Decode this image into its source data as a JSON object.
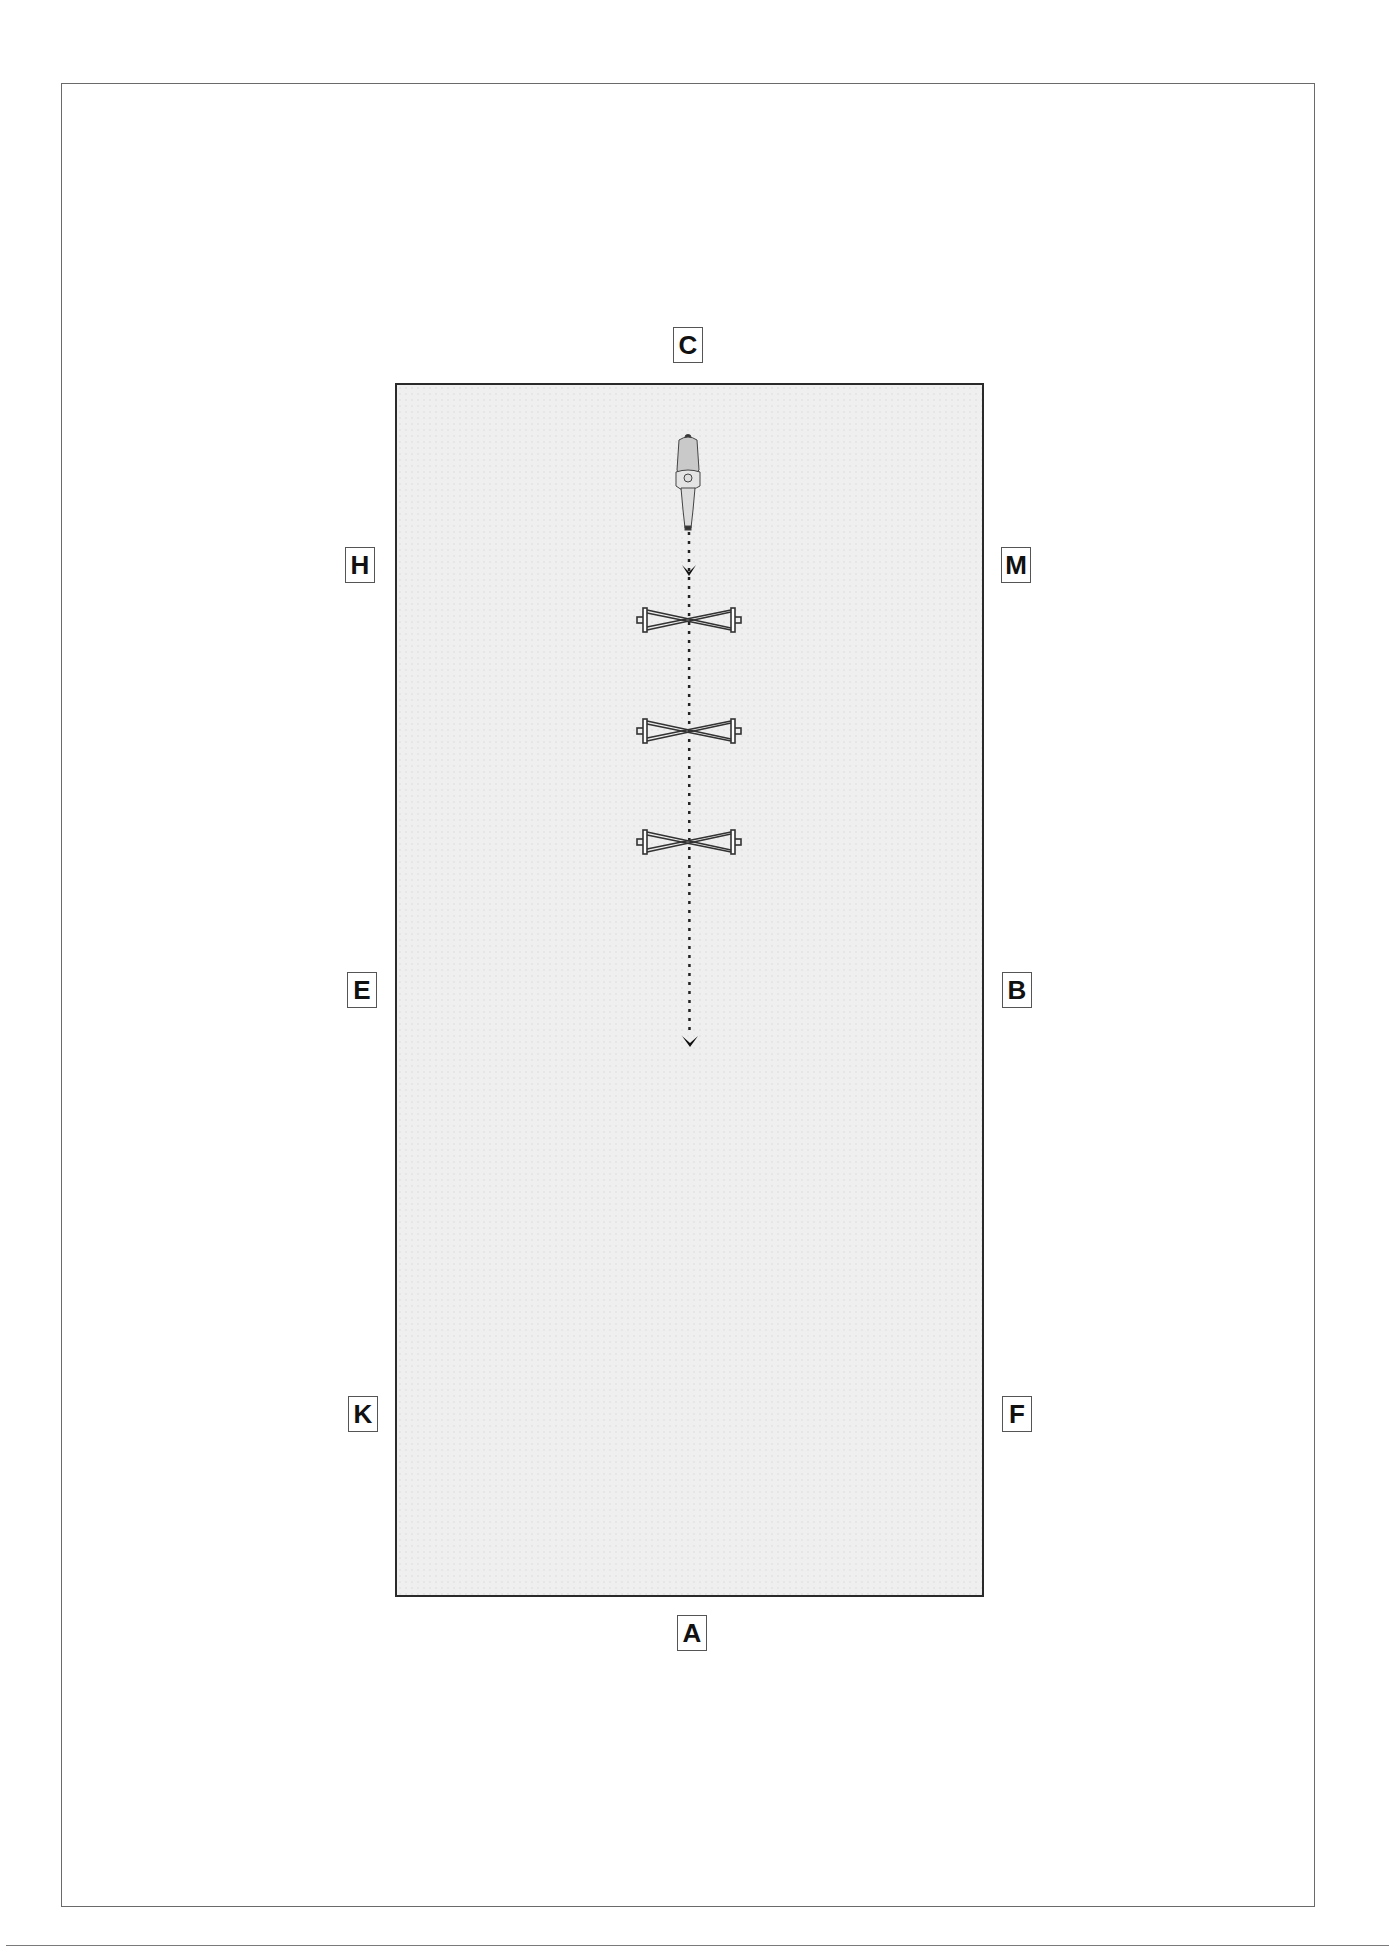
{
  "diagram": {
    "type": "dressage-arena",
    "markers": {
      "C": {
        "label": "C"
      },
      "H": {
        "label": "H"
      },
      "M": {
        "label": "M"
      },
      "E": {
        "label": "E"
      },
      "B": {
        "label": "B"
      },
      "K": {
        "label": "K"
      },
      "F": {
        "label": "F"
      },
      "A": {
        "label": "A"
      }
    },
    "elements": {
      "rider": "horse-and-rider-icon",
      "poles": [
        "cavaletti-1",
        "cavaletti-2",
        "cavaletti-3"
      ],
      "path": "dotted-line-with-arrows"
    },
    "colors": {
      "arena_fill": "#efefef",
      "arena_border": "#2a2a2a",
      "marker_border": "#555555",
      "frame": "#6a6a6a"
    }
  }
}
